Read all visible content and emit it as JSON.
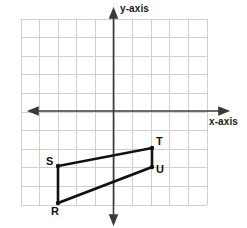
{
  "figure": {
    "background_color": "#ffffff"
  },
  "axes": {
    "x_label": "x-axis",
    "y_label": "y-axis",
    "axis_color": "#3a3a3a",
    "grid_color": "#cfcfcf",
    "grid_columns": 10,
    "grid_rows": 10,
    "origin_cell_x": 5,
    "origin_cell_y": 5,
    "cell_size_px": 18.6,
    "grid_left_px": 21,
    "grid_top_px": 19,
    "x_axis_y_px": 111,
    "y_axis_x_px": 113,
    "x_range": [
      -5,
      5
    ],
    "y_range": [
      -5,
      5
    ],
    "tick_labels_visible": false
  },
  "shape": {
    "name": "RSTU",
    "type": "quadrilateral",
    "stroke_color": "#111111",
    "stroke_width_px": 2.6,
    "fill": "none",
    "closed": true,
    "vertices": [
      {
        "label": "R",
        "grid_x": -3,
        "grid_y": -5,
        "px_x": 58,
        "px_y": 203
      },
      {
        "label": "S",
        "grid_x": -3,
        "grid_y": -3,
        "px_x": 58,
        "px_y": 166
      },
      {
        "label": "T",
        "grid_x": 2,
        "grid_y": -2,
        "px_x": 152,
        "px_y": 148
      },
      {
        "label": "U",
        "grid_x": 2,
        "grid_y": -3,
        "px_x": 152,
        "px_y": 167
      }
    ],
    "edges": [
      {
        "from": "R",
        "to": "S"
      },
      {
        "from": "S",
        "to": "T"
      },
      {
        "from": "T",
        "to": "U"
      },
      {
        "from": "U",
        "to": "R"
      }
    ]
  }
}
